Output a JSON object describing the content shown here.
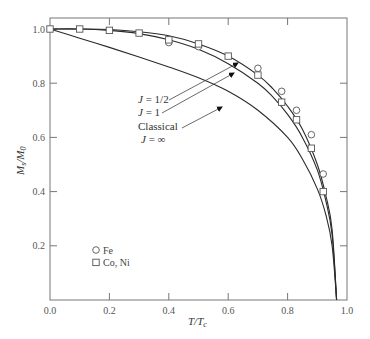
{
  "chart_data": {
    "type": "line",
    "title": "",
    "xlabel": "T/T_c",
    "ylabel": "M_s/M_0",
    "xlim": [
      0.0,
      1.0
    ],
    "ylim": [
      0.0,
      1.0
    ],
    "x_ticks": [
      "0.0",
      "0.2",
      "0.4",
      "0.6",
      "0.8",
      "1.0"
    ],
    "y_ticks": [
      "0.2",
      "0.4",
      "0.6",
      "0.8",
      "1.0"
    ],
    "grid": false,
    "series": [
      {
        "name": "J = 1/2",
        "kind": "theory-curve",
        "x": [
          0.0,
          0.1,
          0.2,
          0.3,
          0.4,
          0.5,
          0.6,
          0.7,
          0.75,
          0.8,
          0.85,
          0.9,
          0.93,
          0.95,
          0.965
        ],
        "y": [
          1.0,
          1.0,
          0.998,
          0.99,
          0.975,
          0.945,
          0.9,
          0.83,
          0.78,
          0.715,
          0.63,
          0.5,
          0.38,
          0.26,
          0.0
        ]
      },
      {
        "name": "J = 1",
        "kind": "theory-curve",
        "x": [
          0.0,
          0.1,
          0.2,
          0.3,
          0.4,
          0.5,
          0.6,
          0.7,
          0.75,
          0.8,
          0.85,
          0.9,
          0.93,
          0.95,
          0.965
        ],
        "y": [
          1.0,
          1.0,
          0.995,
          0.983,
          0.96,
          0.925,
          0.872,
          0.8,
          0.75,
          0.685,
          0.6,
          0.48,
          0.36,
          0.24,
          0.0
        ]
      },
      {
        "name": "Classical J = ∞",
        "kind": "theory-curve",
        "x": [
          0.0,
          0.1,
          0.2,
          0.3,
          0.4,
          0.5,
          0.6,
          0.7,
          0.8,
          0.85,
          0.9,
          0.93,
          0.95,
          0.965
        ],
        "y": [
          1.0,
          0.966,
          0.932,
          0.897,
          0.86,
          0.82,
          0.77,
          0.7,
          0.6,
          0.52,
          0.41,
          0.31,
          0.2,
          0.0
        ]
      },
      {
        "name": "Fe",
        "kind": "data-points",
        "marker": "circle",
        "x": [
          0.4,
          0.5,
          0.7,
          0.78,
          0.83,
          0.88,
          0.92
        ],
        "y": [
          0.95,
          0.935,
          0.855,
          0.77,
          0.7,
          0.61,
          0.465
        ]
      },
      {
        "name": "Co, Ni",
        "kind": "data-points",
        "marker": "square",
        "x": [
          0.0,
          0.1,
          0.2,
          0.3,
          0.4,
          0.5,
          0.6,
          0.7,
          0.78,
          0.83,
          0.88,
          0.92
        ],
        "y": [
          1.0,
          1.0,
          0.995,
          0.985,
          0.96,
          0.945,
          0.9,
          0.83,
          0.73,
          0.665,
          0.56,
          0.4
        ]
      }
    ],
    "annotations": [
      {
        "text": "J = 1/2",
        "points_to": "J = 1/2 curve"
      },
      {
        "text": "J = 1",
        "points_to": "J = 1 curve"
      },
      {
        "text": "Classical",
        "points_to": "Classical curve"
      },
      {
        "text": "J = ∞",
        "points_to": "Classical curve"
      }
    ],
    "legend": {
      "position": "lower-left",
      "entries": [
        {
          "marker": "circle",
          "label": "Fe"
        },
        {
          "marker": "square",
          "label": "Co, Ni"
        }
      ]
    }
  },
  "labels": {
    "xlabel_main": "T/T",
    "xlabel_sub": "c",
    "ylabel_main": "M",
    "ylabel_sub1": "s",
    "ylabel_mid": "/M",
    "ylabel_sub2": "0",
    "annot_j_half": "J = 1/2",
    "annot_j_one": "J = 1",
    "annot_classical": "Classical",
    "annot_j_inf": "J = ∞",
    "legend_fe": "Fe",
    "legend_coni": "Co, Ni"
  },
  "style": {
    "line_color": "#2a2a2a",
    "frame_color": "#777777",
    "marker_color": "#555555"
  }
}
